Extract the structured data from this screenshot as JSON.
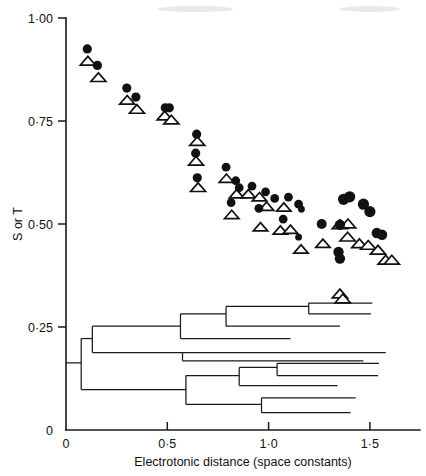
{
  "chart_data": {
    "type": "scatter",
    "title": "",
    "xlabel": "Electrotonic distance (space constants)",
    "ylabel": "S or T",
    "xlim": [
      0,
      1.68
    ],
    "ylim": [
      0,
      1.0
    ],
    "grid": false,
    "legend": "none",
    "xticks": [
      0,
      0.5,
      1.0,
      1.5
    ],
    "xticklabels": [
      "0",
      "0·5",
      "1·0",
      "1·5"
    ],
    "yticks": [
      0,
      0.25,
      0.5,
      0.75,
      1.0
    ],
    "yticklabels": [
      "0",
      "0·25",
      "0·50",
      "0·75",
      "1·00"
    ],
    "series": [
      {
        "name": "S",
        "marker": "filled-circle",
        "color": "#111111",
        "points": [
          {
            "x": 0.105,
            "y": 0.925,
            "r": 4.6
          },
          {
            "x": 0.155,
            "y": 0.885,
            "r": 4.6
          },
          {
            "x": 0.3,
            "y": 0.83,
            "r": 4.6
          },
          {
            "x": 0.345,
            "y": 0.808,
            "r": 4.6
          },
          {
            "x": 0.49,
            "y": 0.782,
            "r": 4.6
          },
          {
            "x": 0.51,
            "y": 0.782,
            "r": 4.6
          },
          {
            "x": 0.645,
            "y": 0.718,
            "r": 4.6
          },
          {
            "x": 0.64,
            "y": 0.672,
            "r": 4.6
          },
          {
            "x": 0.648,
            "y": 0.612,
            "r": 4.6
          },
          {
            "x": 0.79,
            "y": 0.638,
            "r": 4.4
          },
          {
            "x": 0.838,
            "y": 0.605,
            "r": 4.4
          },
          {
            "x": 0.855,
            "y": 0.588,
            "r": 4.4
          },
          {
            "x": 0.918,
            "y": 0.592,
            "r": 4.4
          },
          {
            "x": 0.815,
            "y": 0.552,
            "r": 4.4
          },
          {
            "x": 0.985,
            "y": 0.578,
            "r": 4.4
          },
          {
            "x": 1.03,
            "y": 0.562,
            "r": 4.4
          },
          {
            "x": 0.952,
            "y": 0.538,
            "r": 4.4
          },
          {
            "x": 1.098,
            "y": 0.565,
            "r": 4.4
          },
          {
            "x": 1.148,
            "y": 0.548,
            "r": 4.4
          },
          {
            "x": 1.072,
            "y": 0.512,
            "r": 4.4
          },
          {
            "x": 1.162,
            "y": 0.536,
            "r": 3.4
          },
          {
            "x": 1.148,
            "y": 0.468,
            "r": 3.4
          },
          {
            "x": 1.262,
            "y": 0.5,
            "r": 5.0
          },
          {
            "x": 1.37,
            "y": 0.56,
            "r": 5.6
          },
          {
            "x": 1.4,
            "y": 0.566,
            "r": 5.6
          },
          {
            "x": 1.468,
            "y": 0.548,
            "r": 5.6
          },
          {
            "x": 1.5,
            "y": 0.53,
            "r": 5.6
          },
          {
            "x": 1.352,
            "y": 0.498,
            "r": 5.2
          },
          {
            "x": 1.534,
            "y": 0.478,
            "r": 5.2
          },
          {
            "x": 1.56,
            "y": 0.474,
            "r": 5.2
          },
          {
            "x": 1.345,
            "y": 0.432,
            "r": 5.2
          },
          {
            "x": 1.352,
            "y": 0.416,
            "r": 5.2
          }
        ]
      },
      {
        "name": "T",
        "marker": "open-triangle",
        "color": "#111111",
        "points": [
          {
            "x": 0.108,
            "y": 0.895,
            "s": 7.5
          },
          {
            "x": 0.16,
            "y": 0.855,
            "s": 7.5
          },
          {
            "x": 0.302,
            "y": 0.8,
            "s": 7.5
          },
          {
            "x": 0.35,
            "y": 0.778,
            "s": 7.5
          },
          {
            "x": 0.487,
            "y": 0.762,
            "s": 7.5
          },
          {
            "x": 0.52,
            "y": 0.752,
            "s": 7.5
          },
          {
            "x": 0.648,
            "y": 0.7,
            "s": 7.5
          },
          {
            "x": 0.642,
            "y": 0.652,
            "s": 7.5
          },
          {
            "x": 0.652,
            "y": 0.588,
            "s": 7.5
          },
          {
            "x": 0.792,
            "y": 0.61,
            "s": 7.2
          },
          {
            "x": 0.842,
            "y": 0.572,
            "s": 7.2
          },
          {
            "x": 0.9,
            "y": 0.572,
            "s": 7.2
          },
          {
            "x": 0.818,
            "y": 0.522,
            "s": 7.2
          },
          {
            "x": 0.955,
            "y": 0.565,
            "s": 7.2
          },
          {
            "x": 0.99,
            "y": 0.542,
            "s": 7.2
          },
          {
            "x": 1.075,
            "y": 0.54,
            "s": 7.2
          },
          {
            "x": 0.96,
            "y": 0.492,
            "s": 7.2
          },
          {
            "x": 1.058,
            "y": 0.484,
            "s": 7.2
          },
          {
            "x": 1.108,
            "y": 0.486,
            "s": 7.2
          },
          {
            "x": 1.16,
            "y": 0.438,
            "s": 7.2
          },
          {
            "x": 1.268,
            "y": 0.452,
            "s": 7.2
          },
          {
            "x": 1.352,
            "y": 0.498,
            "s": 7.6
          },
          {
            "x": 1.392,
            "y": 0.5,
            "s": 7.6
          },
          {
            "x": 1.39,
            "y": 0.468,
            "s": 7.6
          },
          {
            "x": 1.448,
            "y": 0.452,
            "s": 7.6
          },
          {
            "x": 1.492,
            "y": 0.448,
            "s": 7.6
          },
          {
            "x": 1.54,
            "y": 0.436,
            "s": 7.6
          },
          {
            "x": 1.578,
            "y": 0.412,
            "s": 7.6
          },
          {
            "x": 1.608,
            "y": 0.412,
            "s": 7.6
          },
          {
            "x": 1.352,
            "y": 0.33,
            "s": 7.6
          },
          {
            "x": 1.366,
            "y": 0.318,
            "s": 7.6
          }
        ]
      }
    ],
    "dendrogram": {
      "description": "Cluster dendrogram overlaid on lower portion of the axes",
      "root_x": 0.0,
      "root_y": 0.163,
      "segments": [
        {
          "type": "h",
          "x1": 0.0,
          "x2": 0.075,
          "y": 0.163
        },
        {
          "type": "v",
          "x": 0.075,
          "y1": 0.098,
          "y2": 0.222
        },
        {
          "type": "h",
          "x1": 0.075,
          "x2": 0.13,
          "y": 0.222
        },
        {
          "type": "v",
          "x": 0.13,
          "y1": 0.188,
          "y2": 0.252
        },
        {
          "type": "h",
          "x1": 0.13,
          "x2": 0.565,
          "y": 0.252
        },
        {
          "type": "v",
          "x": 0.565,
          "y1": 0.222,
          "y2": 0.282
        },
        {
          "type": "h",
          "x1": 0.565,
          "x2": 0.79,
          "y": 0.282
        },
        {
          "type": "v",
          "x": 0.79,
          "y1": 0.252,
          "y2": 0.3
        },
        {
          "type": "h",
          "x1": 0.79,
          "x2": 1.198,
          "y": 0.3
        },
        {
          "type": "v",
          "x": 1.198,
          "y1": 0.282,
          "y2": 0.308
        },
        {
          "type": "h",
          "x1": 1.198,
          "x2": 1.512,
          "y": 0.308
        },
        {
          "type": "h",
          "x1": 1.198,
          "x2": 1.505,
          "y": 0.282
        },
        {
          "type": "h",
          "x1": 0.79,
          "x2": 1.352,
          "y": 0.252
        },
        {
          "type": "h",
          "x1": 0.565,
          "x2": 1.108,
          "y": 0.222
        },
        {
          "type": "h",
          "x1": 0.13,
          "x2": 0.575,
          "y": 0.188
        },
        {
          "type": "v",
          "x": 0.575,
          "y1": 0.168,
          "y2": 0.188
        },
        {
          "type": "h",
          "x1": 0.575,
          "x2": 1.578,
          "y": 0.188
        },
        {
          "type": "h",
          "x1": 0.575,
          "x2": 1.468,
          "y": 0.168
        },
        {
          "type": "h",
          "x1": 0.075,
          "x2": 0.592,
          "y": 0.098
        },
        {
          "type": "v",
          "x": 0.592,
          "y1": 0.062,
          "y2": 0.132
        },
        {
          "type": "h",
          "x1": 0.592,
          "x2": 0.855,
          "y": 0.132
        },
        {
          "type": "v",
          "x": 0.855,
          "y1": 0.108,
          "y2": 0.152
        },
        {
          "type": "h",
          "x1": 0.855,
          "x2": 1.042,
          "y": 0.152
        },
        {
          "type": "v",
          "x": 1.042,
          "y1": 0.132,
          "y2": 0.162
        },
        {
          "type": "h",
          "x1": 1.042,
          "x2": 1.545,
          "y": 0.162
        },
        {
          "type": "h",
          "x1": 1.042,
          "x2": 1.54,
          "y": 0.132
        },
        {
          "type": "h",
          "x1": 0.855,
          "x2": 1.34,
          "y": 0.108
        },
        {
          "type": "h",
          "x1": 0.592,
          "x2": 0.965,
          "y": 0.062
        },
        {
          "type": "v",
          "x": 0.965,
          "y1": 0.042,
          "y2": 0.078
        },
        {
          "type": "h",
          "x1": 0.965,
          "x2": 1.43,
          "y": 0.078
        },
        {
          "type": "h",
          "x1": 0.965,
          "x2": 1.405,
          "y": 0.042
        }
      ]
    }
  }
}
